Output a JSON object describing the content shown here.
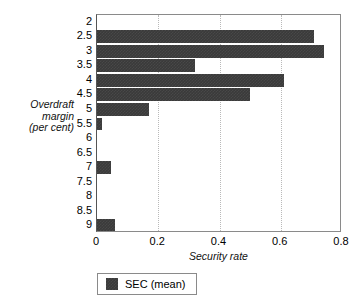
{
  "chart_data": {
    "type": "bar",
    "orientation": "horizontal",
    "title": "",
    "xlabel": "Security rate",
    "ylabel": "Overdraft margin (per cent)",
    "ylabel_lines": [
      "Overdraft",
      "margin",
      "(per cent)"
    ],
    "categories": [
      "2",
      "2.5",
      "3",
      "3.5",
      "4",
      "4.5",
      "5",
      "5.5",
      "6",
      "6.5",
      "7",
      "7.5",
      "8",
      "8.5",
      "9"
    ],
    "values": [
      0,
      0.71,
      0.74,
      0.32,
      0.61,
      0.5,
      0.17,
      0.015,
      0,
      0,
      0.045,
      0,
      0,
      0,
      0.06
    ],
    "series": [
      {
        "name": "SEC (mean)",
        "color": "#3a3a3a",
        "values": [
          0,
          0.71,
          0.74,
          0.32,
          0.61,
          0.5,
          0.17,
          0.015,
          0,
          0,
          0.045,
          0,
          0,
          0,
          0.06
        ]
      }
    ],
    "xlim": [
      0,
      0.8
    ],
    "xticks": [
      "0",
      "0.2",
      "0.4",
      "0.6",
      "0.8"
    ],
    "xtick_values": [
      0,
      0.2,
      0.4,
      0.6,
      0.8
    ],
    "gridlines": [
      0.2,
      0.4,
      0.6
    ],
    "grid": true,
    "grid_axis": "x",
    "grid_style": "dotted",
    "legend": {
      "position": "below",
      "entries": [
        {
          "label": "SEC (mean)",
          "color": "#3a3a3a"
        }
      ]
    }
  }
}
